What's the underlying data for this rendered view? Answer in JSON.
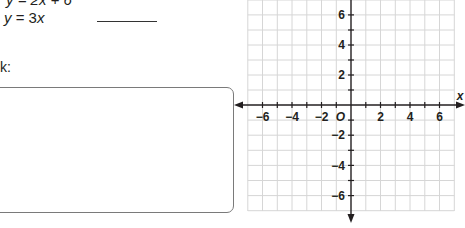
{
  "problem": {
    "cut_equation": "y = 2x + 6",
    "equation": {
      "lhs": "y",
      "eq": " = 3",
      "var": "x"
    },
    "answer_blank": "",
    "work_label": "k:"
  },
  "graph": {
    "x_axis_label": "x",
    "origin_label": "O",
    "x_ticks": [
      "−6",
      "−4",
      "−2",
      "2",
      "4",
      "6"
    ],
    "y_ticks": [
      "6",
      "4",
      "2",
      "−2",
      "−4",
      "−6"
    ],
    "range": {
      "xmin": -7,
      "xmax": 7,
      "ymin": -7,
      "ymax": 7
    },
    "grid_color": "#d9d9d9",
    "axis_color": "#231f20"
  }
}
